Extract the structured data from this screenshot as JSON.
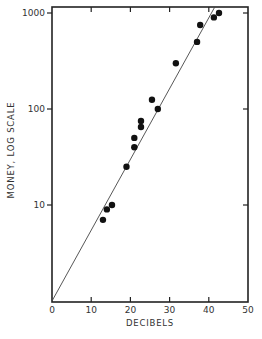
{
  "chart_data": {
    "type": "scatter",
    "title": "",
    "xlabel": "DECIBELS",
    "ylabel": "MONEY, LOG SCALE",
    "xlim": [
      0,
      50
    ],
    "ylim": [
      1,
      1000
    ],
    "yscale": "log",
    "x_ticks": [
      0,
      10,
      20,
      30,
      40,
      50
    ],
    "x_tick_labels": [
      "0",
      "10",
      "20",
      "30",
      "40",
      "50"
    ],
    "y_ticks": [
      10,
      100,
      1000
    ],
    "y_tick_labels": [
      "10",
      "100",
      "1000"
    ],
    "grid": false,
    "legend": null,
    "series": [
      {
        "name": "observations",
        "points": [
          {
            "x": 13,
            "y": 7
          },
          {
            "x": 14,
            "y": 9
          },
          {
            "x": 15.3,
            "y": 10
          },
          {
            "x": 19,
            "y": 25
          },
          {
            "x": 21,
            "y": 40
          },
          {
            "x": 21,
            "y": 50
          },
          {
            "x": 22.7,
            "y": 65
          },
          {
            "x": 22.7,
            "y": 75
          },
          {
            "x": 25.5,
            "y": 125
          },
          {
            "x": 27,
            "y": 100
          },
          {
            "x": 31.6,
            "y": 300
          },
          {
            "x": 37,
            "y": 500
          },
          {
            "x": 37.8,
            "y": 750
          },
          {
            "x": 41.3,
            "y": 900
          },
          {
            "x": 42.6,
            "y": 1000
          }
        ]
      },
      {
        "name": "fit line",
        "type": "line",
        "points": [
          {
            "x": 0,
            "y": 1
          },
          {
            "x": 41.5,
            "y": 1150
          }
        ]
      }
    ]
  }
}
